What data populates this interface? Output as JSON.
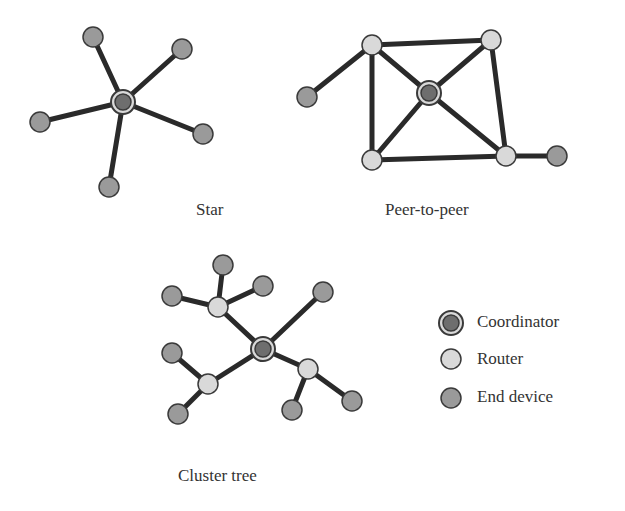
{
  "colors": {
    "edge": "#2a2a2a",
    "coordinator": "#6e6e6e",
    "router": "#d9d9d9",
    "end_device": "#9a9a9a",
    "outline": "#3a3a3a"
  },
  "labels": {
    "star": "Star",
    "p2p": "Peer-to-peer",
    "cluster": "Cluster tree"
  },
  "legend": [
    {
      "type": "coordinator",
      "label": "Coordinator"
    },
    {
      "type": "router",
      "label": "Router"
    },
    {
      "type": "end_device",
      "label": "End device"
    }
  ],
  "topologies": {
    "star": {
      "nodes": [
        {
          "id": "c",
          "type": "coordinator",
          "x": 123,
          "y": 102
        },
        {
          "id": "e1",
          "type": "end_device",
          "x": 93,
          "y": 37
        },
        {
          "id": "e2",
          "type": "end_device",
          "x": 182,
          "y": 49
        },
        {
          "id": "e3",
          "type": "end_device",
          "x": 40,
          "y": 122
        },
        {
          "id": "e4",
          "type": "end_device",
          "x": 203,
          "y": 134
        },
        {
          "id": "e5",
          "type": "end_device",
          "x": 109,
          "y": 187
        }
      ],
      "edges": [
        [
          "c",
          "e1"
        ],
        [
          "c",
          "e2"
        ],
        [
          "c",
          "e3"
        ],
        [
          "c",
          "e4"
        ],
        [
          "c",
          "e5"
        ]
      ]
    },
    "p2p": {
      "nodes": [
        {
          "id": "c",
          "type": "coordinator",
          "x": 429,
          "y": 93
        },
        {
          "id": "r1",
          "type": "router",
          "x": 372,
          "y": 45
        },
        {
          "id": "r2",
          "type": "router",
          "x": 491,
          "y": 40
        },
        {
          "id": "r3",
          "type": "router",
          "x": 372,
          "y": 160
        },
        {
          "id": "r4",
          "type": "router",
          "x": 506,
          "y": 156
        },
        {
          "id": "e1",
          "type": "end_device",
          "x": 307,
          "y": 97
        },
        {
          "id": "e2",
          "type": "end_device",
          "x": 557,
          "y": 156
        }
      ],
      "edges": [
        [
          "r1",
          "r2"
        ],
        [
          "r1",
          "r3"
        ],
        [
          "r2",
          "r4"
        ],
        [
          "r3",
          "r4"
        ],
        [
          "r1",
          "c"
        ],
        [
          "r2",
          "c"
        ],
        [
          "r3",
          "c"
        ],
        [
          "r4",
          "c"
        ],
        [
          "r1",
          "e1"
        ],
        [
          "r4",
          "e2"
        ]
      ]
    },
    "cluster": {
      "nodes": [
        {
          "id": "c",
          "type": "coordinator",
          "x": 263,
          "y": 349
        },
        {
          "id": "r1",
          "type": "router",
          "x": 218,
          "y": 307
        },
        {
          "id": "r2",
          "type": "router",
          "x": 208,
          "y": 384
        },
        {
          "id": "r3",
          "type": "router",
          "x": 308,
          "y": 369
        },
        {
          "id": "e1",
          "type": "end_device",
          "x": 223,
          "y": 265
        },
        {
          "id": "e2",
          "type": "end_device",
          "x": 263,
          "y": 286
        },
        {
          "id": "e3",
          "type": "end_device",
          "x": 172,
          "y": 296
        },
        {
          "id": "e4",
          "type": "end_device",
          "x": 323,
          "y": 292
        },
        {
          "id": "e5",
          "type": "end_device",
          "x": 172,
          "y": 353
        },
        {
          "id": "e6",
          "type": "end_device",
          "x": 178,
          "y": 414
        },
        {
          "id": "e7",
          "type": "end_device",
          "x": 292,
          "y": 410
        },
        {
          "id": "e8",
          "type": "end_device",
          "x": 352,
          "y": 401
        }
      ],
      "edges": [
        [
          "c",
          "r1"
        ],
        [
          "c",
          "r2"
        ],
        [
          "c",
          "r3"
        ],
        [
          "c",
          "e4"
        ],
        [
          "r1",
          "e1"
        ],
        [
          "r1",
          "e2"
        ],
        [
          "r1",
          "e3"
        ],
        [
          "r2",
          "e5"
        ],
        [
          "r2",
          "e6"
        ],
        [
          "r3",
          "e7"
        ],
        [
          "r3",
          "e8"
        ]
      ]
    }
  }
}
